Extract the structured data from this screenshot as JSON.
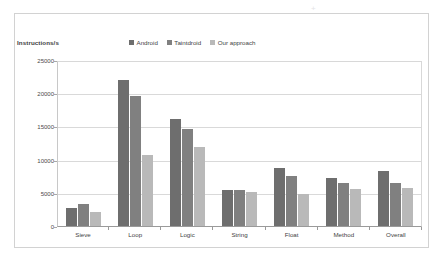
{
  "artifact": {
    "top_smudge": "",
    "mark_1": "+",
    "mark_2": "∨"
  },
  "chart_data": {
    "type": "bar",
    "title": "",
    "xlabel": "",
    "ylabel": "Instructions/s",
    "ylim": [
      0,
      25000
    ],
    "yticks": [
      25000,
      20000,
      15000,
      10000,
      5000,
      0
    ],
    "ytick_labels": [
      "25000",
      "20000",
      "15000",
      "10000",
      "5000",
      "0"
    ],
    "grid": true,
    "legend_position": "top-center",
    "categories": [
      "Sieve",
      "Loop",
      "Logic",
      "String",
      "Float",
      "Method",
      "Overall"
    ],
    "series": [
      {
        "name": "Android",
        "color": "#6e6e6e",
        "values": [
          2900,
          22200,
          16200,
          5600,
          8900,
          7400,
          8400
        ]
      },
      {
        "name": "Taintdroid",
        "color": "#808080",
        "values": [
          3500,
          19800,
          14700,
          5500,
          7700,
          6700,
          6600
        ]
      },
      {
        "name": "Our approach",
        "color": "#b9b9b9",
        "values": [
          2300,
          10900,
          12000,
          5200,
          5000,
          5700,
          5900
        ]
      }
    ]
  }
}
